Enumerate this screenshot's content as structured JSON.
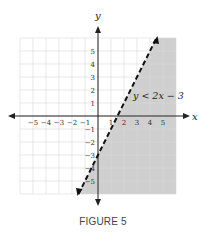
{
  "chart_data": {
    "type": "area",
    "title": "",
    "xlabel": "x",
    "ylabel": "y",
    "xlim": [
      -6,
      6
    ],
    "ylim": [
      -6,
      6
    ],
    "grid": true,
    "x_ticks": [
      "-5",
      "-4",
      "-3",
      "-2",
      "-1",
      "1",
      "2",
      "3",
      "4",
      "5"
    ],
    "y_ticks": [
      "5",
      "4",
      "3",
      "2",
      "1",
      "-1",
      "-2",
      "-3",
      "-4",
      "-5"
    ],
    "boundary": {
      "equation": "y = 2x - 3",
      "slope": 2,
      "intercept": -3,
      "style": "dashed"
    },
    "shaded_region": "below/right of line (y < 2x - 3)",
    "annotation": "y < 2x − 3"
  },
  "figure": {
    "caption": "FIGURE 5",
    "inequality_label": "y < 2x − 3",
    "x_axis_label": "x",
    "y_axis_label": "y"
  }
}
